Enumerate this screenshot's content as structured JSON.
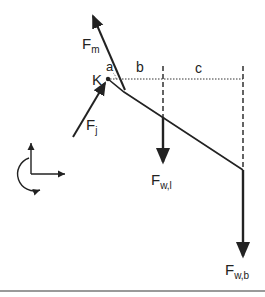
{
  "diagram": {
    "type": "free-body-diagram",
    "colors": {
      "line": "#222222",
      "rule": "#9a9a9a"
    },
    "labels": {
      "fm": {
        "main": "F",
        "sub": "m"
      },
      "k": "K",
      "a": "a",
      "b": "b",
      "c": "c",
      "fj": {
        "main": "F",
        "sub": "j"
      },
      "fwl": {
        "main": "F",
        "sub": "w,l"
      },
      "fwb": {
        "main": "F",
        "sub": "w,b"
      }
    },
    "elements": [
      "muscle-force-arrow",
      "joint-force-arrow",
      "joint-point",
      "beam",
      "horizontal-reference-dotted",
      "dashed-vertical-b",
      "dashed-vertical-c",
      "weight-arrow-l",
      "weight-arrow-b",
      "coordinate-axes",
      "rotation-arrow"
    ]
  }
}
